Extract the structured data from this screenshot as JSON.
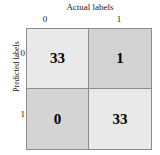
{
  "chart_data": {
    "type": "heatmap",
    "subtype": "confusion-matrix",
    "title": "",
    "xlabel": "Actual labels",
    "ylabel": "Predicted labels",
    "x_tick_labels": [
      "0",
      "1"
    ],
    "y_tick_labels": [
      "0",
      "1"
    ],
    "x_categories": [
      "0",
      "1"
    ],
    "y_categories": [
      "0",
      "1"
    ],
    "grid": true,
    "legend": false,
    "colorbar": false,
    "matrix": [
      [
        33,
        1
      ],
      [
        0,
        33
      ]
    ],
    "cells": [
      {
        "row": "0",
        "col": "0",
        "value": "33",
        "color": "#e9e9e9",
        "position": "top-left"
      },
      {
        "row": "0",
        "col": "1",
        "value": "1",
        "color": "#d2d2d2",
        "position": "top-right"
      },
      {
        "row": "1",
        "col": "0",
        "value": "0",
        "color": "#d4d4d4",
        "position": "bottom-left"
      },
      {
        "row": "1",
        "col": "1",
        "value": "33",
        "color": "#e9e9e9",
        "position": "bottom-right"
      }
    ],
    "values_flat": [
      33,
      1,
      0,
      33
    ],
    "vmin": 0,
    "vmax": 33,
    "colors": {
      "cell_light": "#e9e9e9",
      "cell_dark": "#d2d2d2",
      "border": "#8c8c8c",
      "text": "#000000",
      "background": "#ffffff"
    }
  },
  "axes": {
    "x_title": "Actual labels",
    "y_title": "Predicted labels",
    "x_ticks": [
      "0",
      "1"
    ],
    "y_ticks": [
      "0",
      "1"
    ]
  }
}
